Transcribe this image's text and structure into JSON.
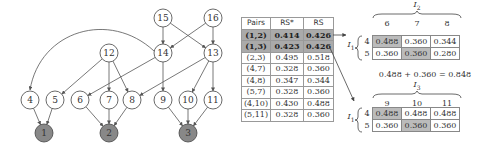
{
  "graph": {
    "nodes": [
      {
        "id": "15",
        "x": 163,
        "y": 18,
        "shaded": false
      },
      {
        "id": "16",
        "x": 213,
        "y": 18,
        "shaded": false
      },
      {
        "id": "12",
        "x": 109,
        "y": 53,
        "shaded": false
      },
      {
        "id": "14",
        "x": 163,
        "y": 53,
        "shaded": false
      },
      {
        "id": "13",
        "x": 213,
        "y": 53,
        "shaded": false
      },
      {
        "id": "4",
        "x": 30,
        "y": 100,
        "shaded": false
      },
      {
        "id": "5",
        "x": 55,
        "y": 100,
        "shaded": false
      },
      {
        "id": "6",
        "x": 80,
        "y": 100,
        "shaded": false
      },
      {
        "id": "7",
        "x": 109,
        "y": 100,
        "shaded": false
      },
      {
        "id": "8",
        "x": 132,
        "y": 100,
        "shaded": false
      },
      {
        "id": "9",
        "x": 163,
        "y": 100,
        "shaded": false
      },
      {
        "id": "10",
        "x": 188,
        "y": 100,
        "shaded": false
      },
      {
        "id": "11",
        "x": 213,
        "y": 100,
        "shaded": false
      },
      {
        "id": "1",
        "x": 44,
        "y": 133,
        "shaded": true
      },
      {
        "id": "2",
        "x": 109,
        "y": 133,
        "shaded": true
      },
      {
        "id": "3",
        "x": 188,
        "y": 133,
        "shaded": true
      }
    ],
    "edges": [
      [
        "15",
        "14"
      ],
      [
        "15",
        "13"
      ],
      [
        "16",
        "14"
      ],
      [
        "16",
        "13"
      ],
      [
        "12",
        "5"
      ],
      [
        "12",
        "7"
      ],
      [
        "12",
        "8"
      ],
      [
        "14",
        "6"
      ],
      [
        "14",
        "9"
      ],
      [
        "14",
        "4"
      ],
      [
        "13",
        "8"
      ],
      [
        "13",
        "10"
      ],
      [
        "13",
        "11"
      ],
      [
        "4",
        "1"
      ],
      [
        "5",
        "1"
      ],
      [
        "6",
        "2"
      ],
      [
        "7",
        "2"
      ],
      [
        "8",
        "2"
      ],
      [
        "9",
        "3"
      ],
      [
        "10",
        "3"
      ],
      [
        "11",
        "3"
      ]
    ]
  },
  "table": {
    "headers": [
      "Pairs",
      "RS*",
      "RS"
    ],
    "rows": [
      {
        "pair": "(1,2)",
        "rs_star": "0.414",
        "rs": "0.426",
        "highlight": true
      },
      {
        "pair": "(1,3)",
        "rs_star": "0.423",
        "rs": "0.426",
        "highlight": true
      },
      {
        "pair": "(2,3)",
        "rs_star": "0.495",
        "rs": "0.518",
        "highlight": false
      },
      {
        "pair": "(4,7)",
        "rs_star": "0.328",
        "rs": "0.360",
        "highlight": false
      },
      {
        "pair": "(4,8)",
        "rs_star": "0.347",
        "rs": "0.344",
        "highlight": false
      },
      {
        "pair": "(5,7)",
        "rs_star": "0.328",
        "rs": "0.360",
        "highlight": false
      },
      {
        "pair": "(4,10)",
        "rs_star": "0.430",
        "rs": "0.488",
        "highlight": false
      },
      {
        "pair": "(5,11)",
        "rs_star": "0.328",
        "rs": "0.360",
        "highlight": false
      }
    ]
  },
  "matrix1": {
    "row_set": "I1",
    "col_set": "I2",
    "row_set_label": "I",
    "row_set_sub": "1",
    "col_set_label": "I",
    "col_set_sub": "2",
    "cols": [
      "6",
      "7",
      "8"
    ],
    "rows": [
      {
        "label": "4",
        "values": [
          "0.488",
          "0.360",
          "0.344"
        ],
        "selected": 0
      },
      {
        "label": "5",
        "values": [
          "0.360",
          "0.360",
          "0.280"
        ],
        "selected": 1
      }
    ]
  },
  "equation": "0.488 + 0.360 = 0.848",
  "matrix2": {
    "row_set": "I1",
    "col_set": "I3",
    "row_set_label": "I",
    "row_set_sub": "1",
    "col_set_label": "I",
    "col_set_sub": "3",
    "cols": [
      "9",
      "10",
      "11"
    ],
    "rows": [
      {
        "label": "4",
        "values": [
          "0.488",
          "0.488",
          "0.488"
        ],
        "selected": 0
      },
      {
        "label": "5",
        "values": [
          "0.360",
          "0.360",
          "0.360"
        ],
        "selected": 1
      }
    ]
  },
  "colors": {
    "shaded_node": "#888888",
    "highlight_row": "#aaaaaa",
    "selected_cell": "#bbbbbb",
    "line": "#555555"
  }
}
